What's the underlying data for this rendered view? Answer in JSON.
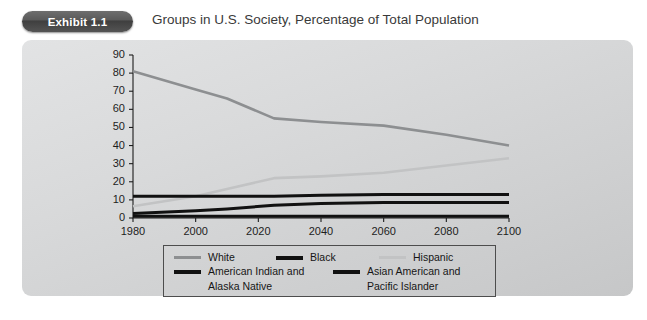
{
  "header": {
    "badge_label": "Exhibit 1.1",
    "title": "Groups in U.S. Society, Percentage of Total Population"
  },
  "colors": {
    "panel_bg": "#d7d8d9",
    "white_series": "#8d8f91",
    "black_series": "#111111",
    "hispanic_series": "#c2c3c4",
    "american_indian_series": "#111111",
    "asian_series": "#111111",
    "axis": "#1d1d1d",
    "badge_bg": "#4a4a4a",
    "badge_text": "#ffffff",
    "title_text": "#3a3a3a"
  },
  "legend": {
    "entries": [
      {
        "label": "White",
        "color": "#8d8f91",
        "weight": "normal"
      },
      {
        "label": "Black",
        "color": "#111111",
        "weight": "thick"
      },
      {
        "label": "Hispanic",
        "color": "#c2c3c4",
        "weight": "normal"
      },
      {
        "label": "American Indian and",
        "label2": "Alaska Native",
        "color": "#111111",
        "weight": "thick"
      },
      {
        "label": "Asian American and",
        "label2": "Pacific Islander",
        "color": "#111111",
        "weight": "thick"
      }
    ]
  },
  "chart_data": {
    "type": "line",
    "title": "Groups in U.S. Society, Percentage of Total Population",
    "xlabel": "",
    "ylabel": "",
    "xlim": [
      1980,
      2100
    ],
    "ylim": [
      0,
      90
    ],
    "xticks": [
      1980,
      2000,
      2020,
      2040,
      2060,
      2080,
      2100
    ],
    "yticks": [
      0,
      10,
      20,
      30,
      40,
      50,
      60,
      70,
      80,
      90
    ],
    "grid": false,
    "legend_position": "bottom",
    "x": [
      1980,
      2000,
      2010,
      2025,
      2040,
      2060,
      2080,
      2100
    ],
    "series": [
      {
        "name": "White",
        "color": "#8d8f91",
        "values": [
          81,
          71,
          66,
          55,
          53,
          51,
          46,
          40
        ]
      },
      {
        "name": "Black",
        "color": "#111111",
        "values": [
          12,
          12,
          12,
          12,
          12.5,
          13,
          13,
          13
        ]
      },
      {
        "name": "Hispanic",
        "color": "#c2c3c4",
        "values": [
          6.5,
          12,
          16,
          22,
          23,
          25,
          29,
          33
        ]
      },
      {
        "name": "American Indian and Alaska Native",
        "color": "#111111",
        "values": [
          1,
          1,
          1,
          1,
          1,
          1,
          1,
          1
        ]
      },
      {
        "name": "Asian American and Pacific Islander",
        "color": "#111111",
        "values": [
          2.5,
          4,
          5,
          7,
          8,
          8.5,
          8.5,
          8.5
        ]
      }
    ]
  }
}
